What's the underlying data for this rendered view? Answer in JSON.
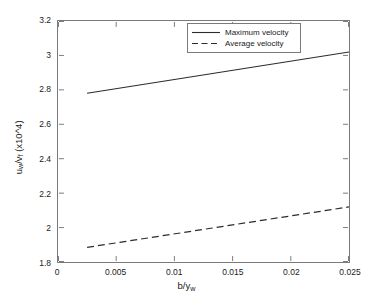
{
  "chart_data": {
    "type": "line",
    "title": "",
    "xlabel": "b/y_w",
    "ylabel": "u_w/v_f (x10^4)",
    "xlim": [
      0,
      0.025
    ],
    "ylim": [
      1.8,
      3.2
    ],
    "xticks": [
      0,
      0.005,
      0.01,
      0.015,
      0.02,
      0.025
    ],
    "xtick_labels": [
      "0",
      "0.005",
      "0.01",
      "0.015",
      "0.02",
      "0.025"
    ],
    "yticks": [
      1.8,
      2.0,
      2.2,
      2.4,
      2.6,
      2.8,
      3.0,
      3.2
    ],
    "ytick_labels": [
      "1.8",
      "2",
      "2.2",
      "2.4",
      "2.6",
      "2.8",
      "3",
      "3.2"
    ],
    "grid": false,
    "legend_position": "top-center-right",
    "series": [
      {
        "name": "Maximum velocity",
        "style": "solid",
        "color": "#2b2b2b",
        "x": [
          0.0025,
          0.025
        ],
        "values": [
          2.78,
          3.02
        ]
      },
      {
        "name": "Average velocity",
        "style": "dashed",
        "color": "#2b2b2b",
        "x": [
          0.0025,
          0.025
        ],
        "values": [
          1.885,
          2.12
        ]
      }
    ]
  },
  "axis_labels": {
    "x_main": "b/y",
    "x_sub": "w",
    "y_numerator": "u",
    "y_num_sub": "w",
    "y_slash": "/v",
    "y_den_sub": "f",
    "y_scale": " (x10",
    "y_scale_sup": "^4",
    "y_scale_close": ")"
  },
  "legend": {
    "items": [
      {
        "label": "Maximum velocity",
        "style": "solid"
      },
      {
        "label": "Average velocity",
        "style": "dashed"
      }
    ]
  }
}
